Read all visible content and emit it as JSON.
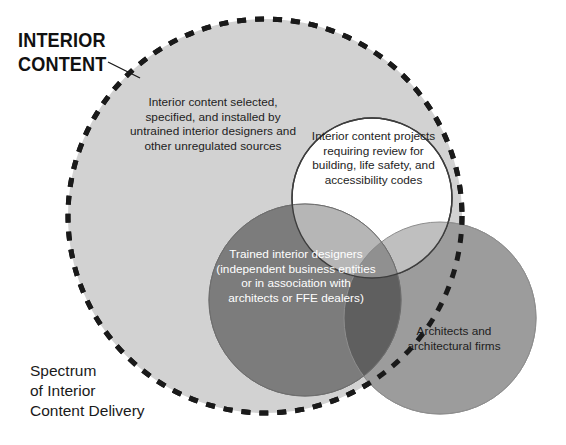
{
  "figure": {
    "title_lines": [
      "Interior",
      "Content"
    ],
    "caption_lines": [
      "Spectrum",
      "of Interior",
      "Content Delivery"
    ]
  },
  "sets": {
    "universe": {
      "name": "Interior Content",
      "label": "Interior content selected, specified, and installed by untrained interior designers and other unregulated sources",
      "fill": "#d2d2d2",
      "stroke": "#1a1a1a",
      "stroke_style": "dashed"
    },
    "codes": {
      "name": "Code Review Projects",
      "label": "Interior content projects requiring review for building, life safety, and accessibility codes",
      "fill": "#ffffff",
      "stroke": "#3a3a3a"
    },
    "designers": {
      "name": "Trained Interior Designers",
      "label": "Trained interior designers (independent business entities or in association with architects or FFE dealers)",
      "fill": "#7c7c7c",
      "stroke": "#6b6b6b"
    },
    "architects": {
      "name": "Architects",
      "label": "Architects and architectural firms",
      "fill": "#9c9c9c",
      "stroke": "#8c8c8c"
    }
  },
  "geometry": {
    "universe": {
      "cx": 265,
      "cy": 216,
      "r": 197
    },
    "codes": {
      "cx": 372,
      "cy": 198,
      "r": 80
    },
    "designers": {
      "cx": 305,
      "cy": 300,
      "r": 96
    },
    "architects": {
      "cx": 440,
      "cy": 318,
      "r": 96
    }
  },
  "leader_line": {
    "x1": 108,
    "y1": 62,
    "x2": 140,
    "y2": 78
  },
  "colors": {
    "background": "#ffffff",
    "text_dark": "#1a1a1a",
    "text_light": "#ffffff"
  }
}
